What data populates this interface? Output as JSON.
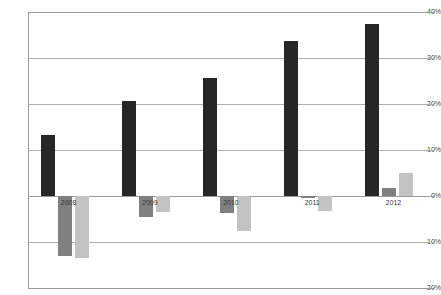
{
  "chart_data": {
    "type": "bar",
    "title": "",
    "subtitle": "",
    "xlabel": "",
    "ylabel": "",
    "categories": [
      "2008",
      "2009",
      "2010",
      "2011",
      "2012"
    ],
    "series": [
      {
        "name": "Series 1",
        "color": "#262626",
        "values": [
          13.2,
          20.7,
          25.7,
          33.8,
          37.5
        ]
      },
      {
        "name": "Series 2",
        "color": "#808080",
        "values": [
          -13.0,
          -4.5,
          -3.8,
          -0.5,
          1.8
        ]
      },
      {
        "name": "Series 3",
        "color": "#c3c3c3",
        "values": [
          -13.5,
          -3.5,
          -7.7,
          -3.2,
          5.0
        ]
      }
    ],
    "ylim": [
      -20,
      40
    ],
    "ytick_values": [
      40,
      30,
      20,
      10,
      0,
      -10,
      -20
    ],
    "ytick_labels": [
      "40%",
      "30%",
      "20%",
      "10%",
      "0%",
      "-10%",
      "-20%"
    ],
    "grid": true,
    "grid_axis": "y",
    "legend": false,
    "legend_position": "none",
    "value_format": "percent",
    "axis_color": "#9a9a9a",
    "gridline_color": "#aeaeae",
    "background_color": "#ffffff",
    "zero_line_value": 0
  }
}
